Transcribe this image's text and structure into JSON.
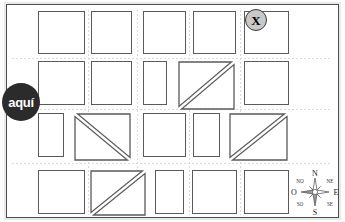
{
  "map": {
    "title": "Mapa de manzanas",
    "background_color": "#ffffff",
    "frame_color": "#4d4d4d",
    "block_stroke_color": "#5a5a5a",
    "street_color": "#d9d9d9"
  },
  "markers": {
    "destination": {
      "label": "X",
      "name": "destination-marker",
      "fill": "#c9c9c9",
      "stroke": "#3a3a3a",
      "x": 245,
      "y": 9
    },
    "current_location": {
      "label": "aquí",
      "name": "you-are-here-marker",
      "fill": "#2b2b2b",
      "text_color": "#ffffff",
      "x": 2,
      "y": 83
    }
  },
  "compass": {
    "name": "compass-rose",
    "x": 289,
    "y": 167,
    "cardinal": {
      "north": "N",
      "south": "S",
      "east": "E",
      "west": "O"
    },
    "intercardinal": {
      "northwest": "NO",
      "northeast": "NE",
      "southwest": "SO",
      "southeast": "SE"
    }
  },
  "blocks": [
    {
      "id": "r1c1",
      "shape": "square",
      "x": 38,
      "y": 11,
      "w": 47,
      "h": 43
    },
    {
      "id": "r1c2",
      "shape": "square",
      "x": 91,
      "y": 11,
      "w": 41,
      "h": 43
    },
    {
      "id": "r1c3",
      "shape": "square",
      "x": 143,
      "y": 11,
      "w": 43,
      "h": 43
    },
    {
      "id": "r1c4",
      "shape": "square",
      "x": 193,
      "y": 11,
      "w": 43,
      "h": 43
    },
    {
      "id": "r1c5",
      "shape": "square",
      "x": 244,
      "y": 11,
      "w": 45,
      "h": 43
    },
    {
      "id": "r2c1",
      "shape": "square",
      "x": 38,
      "y": 61,
      "w": 47,
      "h": 44
    },
    {
      "id": "r2c2",
      "shape": "square",
      "x": 91,
      "y": 61,
      "w": 41,
      "h": 44
    },
    {
      "id": "r2c3",
      "shape": "narrow",
      "x": 143,
      "y": 61,
      "w": 24,
      "h": 44
    },
    {
      "id": "r2c4",
      "shape": "diag-tlbr",
      "x": 178,
      "y": 61,
      "w": 57,
      "h": 49
    },
    {
      "id": "r2c5",
      "shape": "square",
      "x": 244,
      "y": 61,
      "w": 45,
      "h": 44
    },
    {
      "id": "r3c1",
      "shape": "narrow",
      "x": 38,
      "y": 113,
      "w": 26,
      "h": 44
    },
    {
      "id": "r3c2",
      "shape": "diag-bltr",
      "x": 74,
      "y": 113,
      "w": 57,
      "h": 48
    },
    {
      "id": "r3c3",
      "shape": "square",
      "x": 143,
      "y": 113,
      "w": 43,
      "h": 44
    },
    {
      "id": "r3c4",
      "shape": "narrow",
      "x": 193,
      "y": 113,
      "w": 27,
      "h": 44
    },
    {
      "id": "r3c5",
      "shape": "diag-tlbr",
      "x": 229,
      "y": 113,
      "w": 59,
      "h": 48
    },
    {
      "id": "r4c1",
      "shape": "square",
      "x": 38,
      "y": 170,
      "w": 47,
      "h": 44
    },
    {
      "id": "r4c2",
      "shape": "diag-tlbr",
      "x": 90,
      "y": 170,
      "w": 56,
      "h": 46
    },
    {
      "id": "r4c3",
      "shape": "narrow",
      "x": 155,
      "y": 170,
      "w": 29,
      "h": 44
    },
    {
      "id": "r4c4",
      "shape": "square",
      "x": 192,
      "y": 170,
      "w": 45,
      "h": 44
    },
    {
      "id": "r4c5",
      "shape": "square",
      "x": 244,
      "y": 170,
      "w": 45,
      "h": 44
    }
  ],
  "streets": {
    "vertical_x": [
      88,
      137,
      189,
      240
    ],
    "horizontal_y": [
      58,
      109,
      163
    ]
  }
}
